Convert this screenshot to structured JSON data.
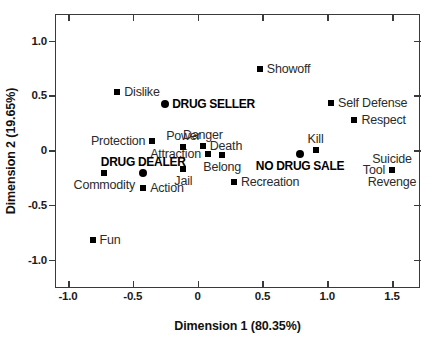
{
  "chart_data": {
    "type": "scatter",
    "title": "",
    "xlabel": "Dimension 1 (80.35%)",
    "ylabel": "Dimension 2 (19.65%)",
    "xlim": [
      -1.1,
      1.72
    ],
    "ylim": [
      -1.24,
      1.24
    ],
    "xticks": [
      -1.0,
      -0.5,
      0,
      0.5,
      1.0,
      1.5
    ],
    "xticklabels": [
      "-1.0",
      "-0.5",
      "0",
      "0.5",
      "1.0",
      "1.5"
    ],
    "yticks": [
      1.0,
      0.5,
      0,
      -0.5,
      -1.0
    ],
    "yticklabels": [
      "1.0",
      "0.5",
      "0",
      "-0.5",
      "-1.0"
    ],
    "grid": false,
    "legend": "none",
    "marker_colors": {
      "square": "#000000",
      "circle": "#000000"
    },
    "points": [
      {
        "label": "Showoff",
        "x": 0.48,
        "y": 0.74,
        "marker": "square",
        "bold": false,
        "label_pos": "right"
      },
      {
        "label": "Dislike",
        "x": -0.62,
        "y": 0.53,
        "marker": "square",
        "bold": false,
        "label_pos": "right"
      },
      {
        "label": "DRUG SELLER",
        "x": -0.25,
        "y": 0.42,
        "marker": "circle",
        "bold": true,
        "label_pos": "right"
      },
      {
        "label": "Self Defense",
        "x": 1.03,
        "y": 0.43,
        "marker": "square",
        "bold": false,
        "label_pos": "right"
      },
      {
        "label": "Respect",
        "x": 1.21,
        "y": 0.27,
        "marker": "square",
        "bold": false,
        "label_pos": "right"
      },
      {
        "label": "Protection",
        "x": -0.35,
        "y": 0.08,
        "marker": "square",
        "bold": false,
        "label_pos": "left"
      },
      {
        "label": "Power",
        "x": -0.11,
        "y": 0.03,
        "marker": "square",
        "bold": false,
        "label_pos": "above"
      },
      {
        "label": "Danger",
        "x": 0.04,
        "y": 0.035,
        "marker": "square",
        "bold": false,
        "label_pos": "above"
      },
      {
        "label": "Kill",
        "x": 0.91,
        "y": 0.0,
        "marker": "square",
        "bold": false,
        "label_pos": "above"
      },
      {
        "label": "Death",
        "x": 0.04,
        "y": 0.035,
        "marker": "none",
        "bold": false,
        "label_pos": "right"
      },
      {
        "label": "Attraction",
        "x": 0.08,
        "y": -0.04,
        "marker": "square",
        "bold": false,
        "label_pos": "left"
      },
      {
        "label": "Belong",
        "x": 0.19,
        "y": -0.045,
        "marker": "square",
        "bold": false,
        "label_pos": "below"
      },
      {
        "label": "Suicide",
        "x": 1.5,
        "y": -0.185,
        "marker": "none",
        "bold": false,
        "label_pos": "above"
      },
      {
        "label": "DRUG DEALER",
        "x": -0.42,
        "y": -0.21,
        "marker": "circle",
        "bold": true,
        "label_pos": "above"
      },
      {
        "label": "NO DRUG SALE",
        "x": 0.79,
        "y": -0.04,
        "marker": "circle",
        "bold": true,
        "label_pos": "below"
      },
      {
        "label": "Jail",
        "x": -0.11,
        "y": -0.17,
        "marker": "square",
        "bold": false,
        "label_pos": "below"
      },
      {
        "label": "Commodity",
        "x": -0.72,
        "y": -0.21,
        "marker": "square",
        "bold": false,
        "label_pos": "below"
      },
      {
        "label": "Tool",
        "x": 1.5,
        "y": -0.185,
        "marker": "square",
        "bold": false,
        "label_pos": "left"
      },
      {
        "label": "Revenge",
        "x": 1.5,
        "y": -0.185,
        "marker": "none",
        "bold": false,
        "label_pos": "below"
      },
      {
        "label": "Action",
        "x": -0.42,
        "y": -0.35,
        "marker": "square",
        "bold": false,
        "label_pos": "right"
      },
      {
        "label": "Recreation",
        "x": 0.28,
        "y": -0.29,
        "marker": "square",
        "bold": false,
        "label_pos": "right"
      },
      {
        "label": "Fun",
        "x": -0.81,
        "y": -0.82,
        "marker": "square",
        "bold": false,
        "label_pos": "right"
      }
    ]
  }
}
